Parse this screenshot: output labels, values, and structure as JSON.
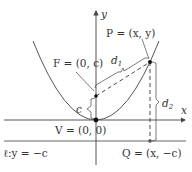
{
  "figure": {
    "colors": {
      "curve": "#555555",
      "axes": "#444444",
      "dashed": "#333333",
      "points": "#111111",
      "text": "#333333"
    },
    "axes": {
      "x_label": "x",
      "y_label": "y"
    },
    "points": {
      "P": {
        "label": "P = (x, y)"
      },
      "F": {
        "label": "F = (0, c)"
      },
      "V": {
        "label": "V = (0, 0)"
      },
      "Q": {
        "label": "Q = (x, −c)"
      }
    },
    "distances": {
      "d1": {
        "base": "d",
        "sub": "1"
      },
      "d2": {
        "base": "d",
        "sub": "2"
      },
      "c": "c"
    },
    "directrix": {
      "label": "ℓ:y = −c"
    }
  }
}
